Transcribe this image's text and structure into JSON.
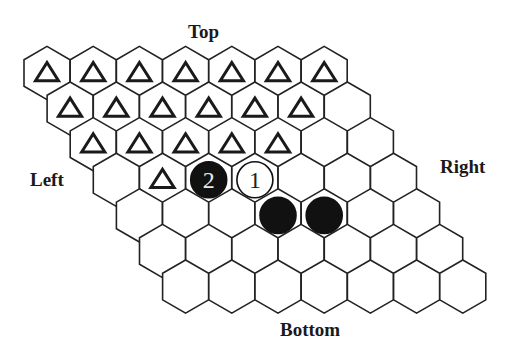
{
  "labels": {
    "top": "Top",
    "bottom": "Bottom",
    "left": "Left",
    "right": "Right"
  },
  "board": {
    "size": 7,
    "origin": {
      "x": 47,
      "y": 73
    },
    "col_step": 46.2,
    "row_step_x": 23.1,
    "row_step_y": 35.6,
    "hex_radius": 26.6,
    "stroke_color": "#222222",
    "fill_color": "#ffffff"
  },
  "marks": {
    "triangle_cells": [
      [
        0,
        0
      ],
      [
        0,
        1
      ],
      [
        0,
        2
      ],
      [
        0,
        3
      ],
      [
        0,
        4
      ],
      [
        0,
        5
      ],
      [
        0,
        6
      ],
      [
        1,
        0
      ],
      [
        1,
        1
      ],
      [
        1,
        2
      ],
      [
        1,
        3
      ],
      [
        1,
        4
      ],
      [
        1,
        5
      ],
      [
        2,
        0
      ],
      [
        2,
        1
      ],
      [
        2,
        2
      ],
      [
        2,
        3
      ],
      [
        2,
        4
      ],
      [
        3,
        1
      ]
    ]
  },
  "stones": [
    {
      "row": 3,
      "col": 2,
      "color": "black",
      "label": "2"
    },
    {
      "row": 3,
      "col": 3,
      "color": "white",
      "label": "1"
    },
    {
      "row": 4,
      "col": 3,
      "color": "black",
      "label": ""
    },
    {
      "row": 4,
      "col": 4,
      "color": "black",
      "label": ""
    }
  ],
  "colors": {
    "black_stone": "#111111",
    "white_stone": "#ffffff",
    "line": "#222222",
    "label_on_black": "#e8e8e8",
    "label_on_white": "#222222"
  }
}
